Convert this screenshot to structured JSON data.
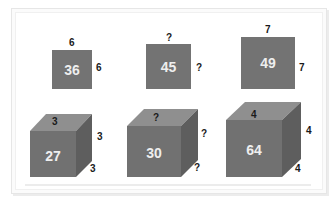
{
  "colors": {
    "front": "#717171",
    "top": "#8f8f8f",
    "side": "#5e5e5e",
    "value_text": "#eeeeee",
    "label_text": "#1a1a1a"
  },
  "squares": [
    {
      "value": "36",
      "top_label": "6",
      "side_label": "6"
    },
    {
      "value": "45",
      "top_label": "?",
      "side_label": "?"
    },
    {
      "value": "49",
      "top_label": "7",
      "side_label": "7"
    }
  ],
  "cubes": [
    {
      "value": "27",
      "top_label": "3",
      "side_label": "3",
      "depth_label": "3"
    },
    {
      "value": "30",
      "top_label": "?",
      "side_label": "?",
      "depth_label": "?"
    },
    {
      "value": "64",
      "top_label": "4",
      "side_label": "4",
      "depth_label": "4"
    }
  ]
}
